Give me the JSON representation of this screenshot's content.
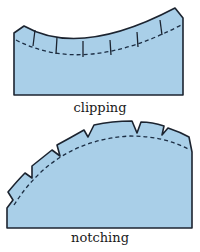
{
  "figures": [
    {
      "id": "clipping",
      "label": "clipping",
      "description": "Concave curved seam with straight clips cut into the seam allowance",
      "clip_count": 6
    },
    {
      "id": "notching",
      "label": "notching",
      "description": "Convex curved seam with V-shaped notches cut out of the seam allowance",
      "notch_count": 6
    }
  ],
  "colors": {
    "fabric_fill": "#a9cfe8",
    "outline": "#1c2430",
    "seam_line": "#1c2e44",
    "label_text": "#1a1a1a"
  }
}
